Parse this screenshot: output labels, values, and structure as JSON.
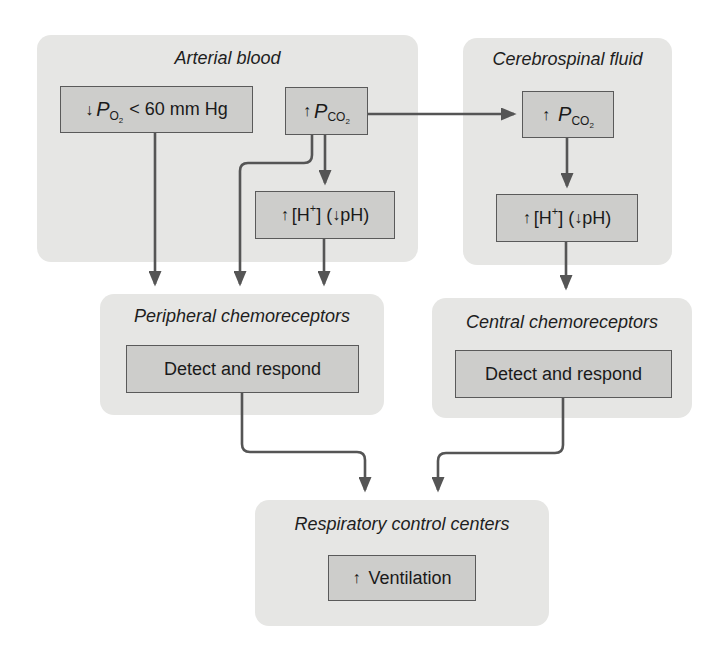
{
  "colors": {
    "panel_bg": "#e6e6e4",
    "box_bg": "#cdcdcb",
    "line": "#555555"
  },
  "panels": {
    "arterial": {
      "title": "Arterial blood",
      "po2_box": {
        "arrow": "↓",
        "symbol": "P",
        "subscript": "O",
        "sub_digit": "2",
        "text": "< 60 mm Hg"
      },
      "pco2_box": {
        "arrow": "↑",
        "symbol": "P",
        "subscript": "CO",
        "sub_digit": "2"
      },
      "h_box": {
        "arrow": "↑",
        "prefix": "[H",
        "superscript": "+",
        "suffix": "] (",
        "arrow2": "↓",
        "ph": "pH)"
      }
    },
    "csf": {
      "title": "Cerebrospinal fluid",
      "pco2_box": {
        "arrow": "↑",
        "symbol": "P",
        "subscript": "CO",
        "sub_digit": "2"
      },
      "h_box": {
        "arrow": "↑",
        "prefix": "[H",
        "superscript": "+",
        "suffix": "] (",
        "arrow2": "↓",
        "ph": "pH)"
      }
    },
    "peripheral": {
      "title": "Peripheral chemoreceptors",
      "box": "Detect and respond"
    },
    "central": {
      "title": "Central chemoreceptors",
      "box": "Detect and respond"
    },
    "respiratory": {
      "title": "Respiratory control centers",
      "box": {
        "arrow": "↑",
        "text": "Ventilation"
      }
    }
  }
}
